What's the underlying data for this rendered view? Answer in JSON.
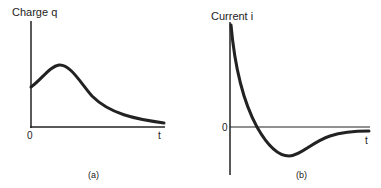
{
  "figure_a": {
    "ylabel": "Charge q",
    "xlabel": "t",
    "origin": "0",
    "caption": "(a)"
  },
  "figure_b": {
    "ylabel": "Current i",
    "xlabel": "t",
    "zero": "0",
    "caption": "(b)"
  },
  "colors": {
    "ink": "#222222",
    "background": "#ffffff"
  }
}
